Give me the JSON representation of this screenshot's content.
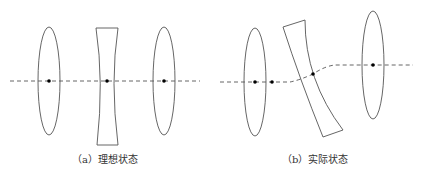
{
  "panels": [
    {
      "id": "a",
      "caption": "（a）理想状态",
      "elements": [
        "convex-lens",
        "concave-lens",
        "convex-lens"
      ],
      "optical_axis": "straight"
    },
    {
      "id": "b",
      "caption": "（b）实际状态",
      "elements": [
        "convex-lens",
        "tilted-concave-lens",
        "convex-lens"
      ],
      "optical_axis": "offset"
    }
  ],
  "colors": {
    "stroke": "#555555",
    "dot": "#000000",
    "axis": "#555555"
  }
}
